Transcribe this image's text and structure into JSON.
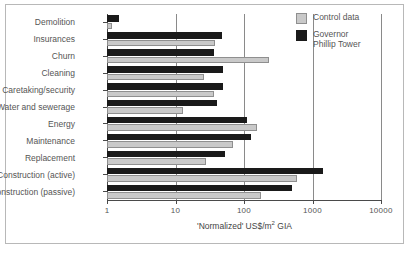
{
  "chart_data": {
    "type": "bar",
    "orientation": "horizontal",
    "title": "",
    "xlabel": "'Normalized' US$/m2 GIA",
    "xlabel_parts": {
      "prefix": "'Normalized' US$/m",
      "sup": "2",
      "suffix": " GIA"
    },
    "ylabel": "",
    "xscale": "log",
    "xlim": [
      1,
      10000
    ],
    "xticks": [
      1,
      10,
      100,
      1000,
      10000
    ],
    "xticklabels": [
      "1",
      "10",
      "100",
      "1000",
      "10000"
    ],
    "grid": true,
    "grid_axis": "x",
    "legend_position": "upper right",
    "categories": [
      "Demolition",
      "Insurances",
      "Churn",
      "Cleaning",
      "Caretaking/security",
      "Water and sewerage",
      "Energy",
      "Maintenance",
      "Replacement",
      "Construction (active)",
      "Construction (passive)"
    ],
    "series": [
      {
        "name": "Governor Phillip Tower",
        "color": "#1a1a1a",
        "values": [
          1.5,
          48,
          36,
          50,
          50,
          41,
          110,
          125,
          52,
          1400,
          500
        ]
      },
      {
        "name": "Control data",
        "color": "#c9c9c9",
        "values": [
          1.2,
          38,
          230,
          26,
          36,
          13,
          155,
          70,
          28,
          600,
          180
        ]
      }
    ]
  },
  "legend": {
    "items": [
      {
        "label": "Control data",
        "swatch": "light"
      },
      {
        "label": "Governor\nPhillip Tower",
        "swatch": "dark"
      }
    ]
  }
}
